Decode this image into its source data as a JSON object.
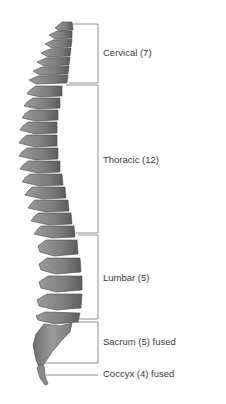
{
  "regions": [
    {
      "key": "cervical",
      "label": "Cervical (7)",
      "count": 7
    },
    {
      "key": "thoracic",
      "label": "Thoracic (12)",
      "count": 12
    },
    {
      "key": "lumbar",
      "label": "Lumbar (5)",
      "count": 5
    },
    {
      "key": "sacrum",
      "label": "Sacrum (5) fused",
      "count": 5
    },
    {
      "key": "coccyx",
      "label": "Coccyx (4) fused",
      "count": 4
    }
  ],
  "colors": {
    "bone": "#8a8a8a",
    "bone_dark": "#5e5e5e",
    "bone_light": "#b4b4b4",
    "bracket": "#777777",
    "text": "#3a3a3a"
  }
}
